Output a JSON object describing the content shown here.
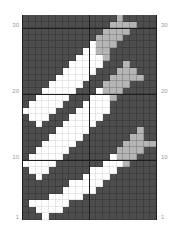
{
  "chart": {
    "type": "knitting-chart",
    "columns": 20,
    "rows": 31,
    "colors": {
      "D": "#4d4d4d",
      "W": "#ffffff",
      "L": "#b5b5b5"
    },
    "row_labels": [
      {
        "row": 30,
        "text": "30"
      },
      {
        "row": 20,
        "text": "20"
      },
      {
        "row": 10,
        "text": "10"
      },
      {
        "row": 1,
        "text": "1"
      }
    ],
    "grid_top_to_bottom": [
      "DDDDDDDDDDDDDDLDDDDD",
      "DDDDDDDDDDDDDLLLLDDD",
      "DDDDDDDDDDDDLLLLDDDD",
      "DDDDDDDDDDDLLLLDDDDD",
      "DDDDDDDDDDWLLLDDDDDD",
      "DDDDDDDDDWWLLDDDDDDD",
      "DDDDDDDDWWWWLDDDDDDD",
      "DDDDDDDWWWWWDDDLDDDD",
      "DDDDDDWWWWWDDDLLLDDD",
      "DDDDDWWWWWDDDLLLLLDD",
      "DDDDWWWWWDDDLLLLDDDD",
      "DDDWWWWWDDDWLLLDDDDD",
      "DDWWWWWDDDWWWLDDDDDD",
      "DWWWWWDDDWWWWDDDDDDD",
      "WWWWWDDDWWWWWDDDDDDD",
      "DWWWDDDWWWWWDDDDDDDD",
      "DDWDDDWWWWWDDDDDDDDD",
      "DDDDDWWWWWDDDDDDDLDD",
      "DDDDWWWWWDDDDDDDLLDD",
      "DDDWWWWWDDDDDDDLLLLL",
      "DDWWWWWDDDDDDDLLLLDD",
      "DWWWWWDDDDDDDWLLLDDD",
      "WWWWWDDDDDDDWWWLDDDD",
      "DWWWDDDDDDWWWWDDDDDD",
      "DDWDDDDDDWWWWDDDDDDD",
      "DDDDDDDWWWWWDDDDDDDD",
      "DDDDDDWWWWWDDDDDDDDD",
      "DDDDWWWWWDDDDDDDDDDD",
      "DWWWWWWDDDDDDDDDDDDD",
      "DDWWWWDDDDDDDDDDDDDD",
      "DDDWDDDDDDDDDDDDDDDD"
    ]
  }
}
